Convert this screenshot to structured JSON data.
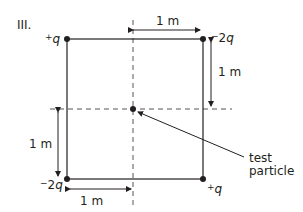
{
  "figure": {
    "label": "III.",
    "charges": {
      "top_left": {
        "sign": "+",
        "symbol": "q"
      },
      "top_right": {
        "sign": "−",
        "coef": "2",
        "symbol": "q"
      },
      "bottom_left": {
        "sign": "−",
        "coef": "2",
        "symbol": "q"
      },
      "bottom_right": {
        "sign": "+",
        "symbol": "q"
      }
    },
    "dimensions": {
      "top": "1 m",
      "right": "1 m",
      "left": "1 m",
      "bottom": "1 m"
    },
    "test_particle": {
      "line1": "test",
      "line2": "particle"
    },
    "colors": {
      "ink": "#231f20",
      "dashed": "#555555"
    }
  }
}
